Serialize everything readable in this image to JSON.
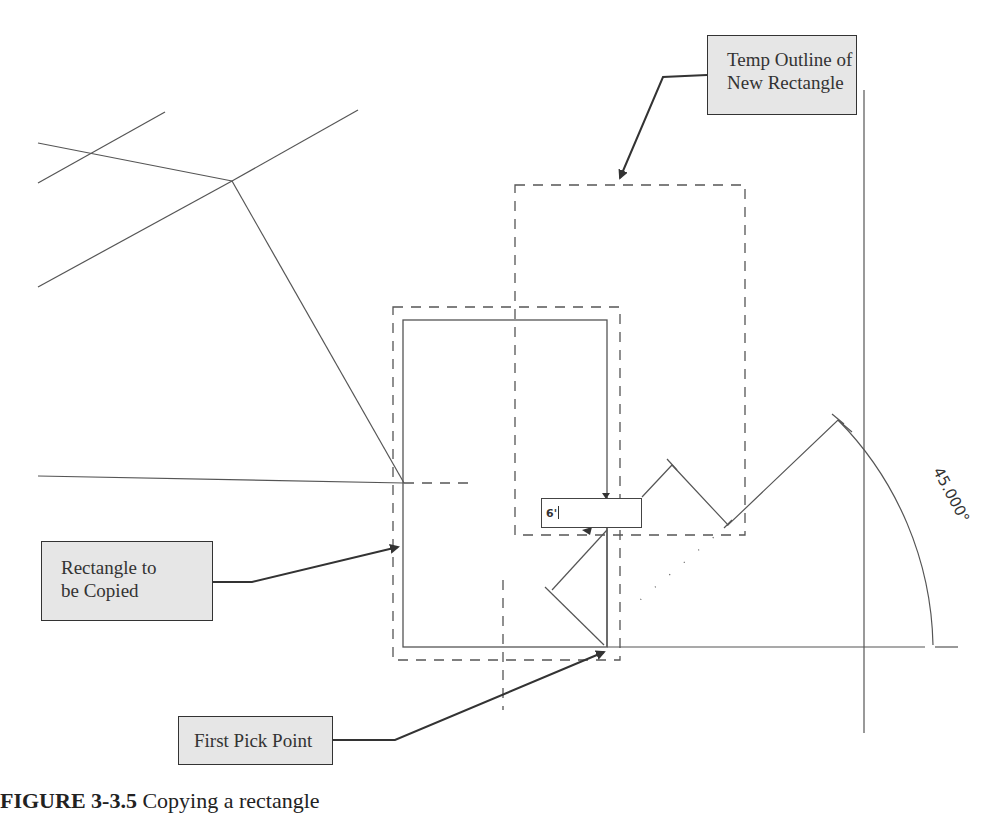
{
  "figure": {
    "callouts": {
      "temp_outline": {
        "line1": "Temp Outline of",
        "line2": "New Rectangle"
      },
      "rectangle_to_copy": {
        "line1": "Rectangle to",
        "line2": "be Copied"
      },
      "first_pick_point": {
        "line1": "First Pick Point"
      }
    },
    "dimension_input": {
      "value": "6'"
    },
    "angle_label": "45.000°",
    "caption": {
      "label": "FIGURE 3-3.5",
      "text": "Copying a rectangle"
    }
  },
  "colors": {
    "line": "#555555",
    "callout_fill": "#e6e6e6",
    "callout_border": "#333333",
    "arrow": "#333333"
  }
}
